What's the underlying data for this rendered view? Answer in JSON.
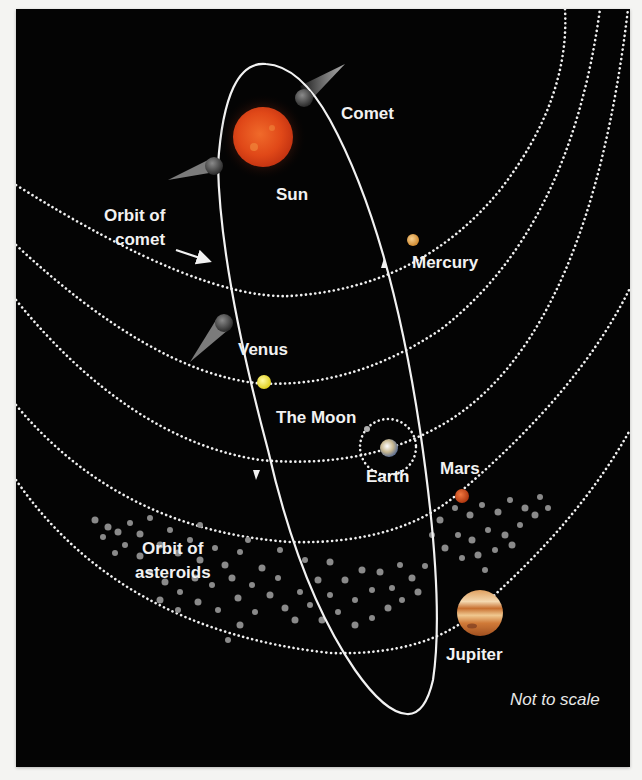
{
  "labels": {
    "comet": "Comet",
    "sun": "Sun",
    "orbit_of_comet_line1": "Orbit of",
    "orbit_of_comet_line2": "comet",
    "mercury": "Mercury",
    "venus": "Venus",
    "the_moon": "The Moon",
    "earth": "Earth",
    "mars": "Mars",
    "orbit_of_asteroids_line1": "Orbit of",
    "orbit_of_asteroids_line2": "asteroids",
    "jupiter": "Jupiter",
    "note": "Not to scale"
  },
  "colors": {
    "background": "#040404",
    "page": "#f4f4f2",
    "sun": "#e0471a",
    "mercury": "#e0a04a",
    "venus": "#f0e040",
    "earth": "#c8c0a0",
    "mars": "#d0501e",
    "jupiter": "#d89050",
    "asteroid": "#8a8a8a",
    "orbit_line": "#f0f0f0"
  },
  "bodies": [
    {
      "name": "Sun",
      "cx": 263,
      "cy": 137,
      "r": 30
    },
    {
      "name": "Mercury",
      "cx": 397,
      "cy": 232,
      "r": 6
    },
    {
      "name": "Venus",
      "cx": 248,
      "cy": 374,
      "r": 7
    },
    {
      "name": "Earth",
      "cx": 374,
      "cy": 440,
      "r": 10
    },
    {
      "name": "The Moon",
      "cx": 352,
      "cy": 419,
      "r": 3
    },
    {
      "name": "Mars",
      "cx": 446,
      "cy": 487,
      "r": 7
    },
    {
      "name": "Jupiter",
      "cx": 466,
      "cy": 604,
      "r": 23
    }
  ],
  "comets": [
    {
      "name": "comet-top-right",
      "x": 296,
      "y": 93,
      "tail_x": 330,
      "tail_y": 55
    },
    {
      "name": "comet-upper-left",
      "x": 204,
      "y": 161,
      "tail_x": 150,
      "tail_y": 177
    },
    {
      "name": "comet-middle-left",
      "x": 208,
      "y": 316,
      "tail_x": 177,
      "tail_y": 357
    }
  ]
}
